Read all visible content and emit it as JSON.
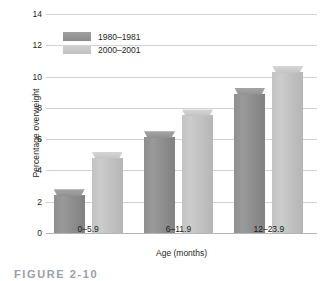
{
  "chart_data": {
    "type": "bar",
    "title": "",
    "subtitle": "",
    "xlabel": "Age (months)",
    "ylabel": "Percentage overweight",
    "categories": [
      "0–5.9",
      "6–11.9",
      "12–23.9"
    ],
    "series": [
      {
        "name": "1980–1981",
        "values": [
          2.8,
          6.5,
          9.3
        ],
        "color": "#8c8c8c"
      },
      {
        "name": "2000–2001",
        "values": [
          5.2,
          7.9,
          10.7
        ],
        "color": "#c0c0c0"
      }
    ],
    "ylim": [
      0,
      14
    ],
    "ytick_values": [
      0,
      2,
      4,
      6,
      8,
      10,
      12,
      14
    ],
    "ytick_labels": [
      "0",
      "2",
      "4",
      "6",
      "8",
      "10",
      "12",
      "14"
    ],
    "grid": "horizontal",
    "legend_position": "upper-left-inside"
  },
  "caption": {
    "text": "FIGURE 2-10"
  }
}
